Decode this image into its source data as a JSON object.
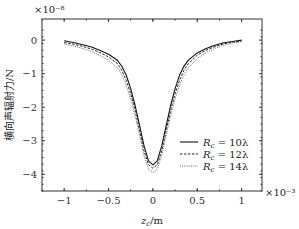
{
  "chart_data": {
    "type": "line",
    "title": "",
    "xlabel": "z_c/m",
    "ylabel": "横向声辐射力/N",
    "x_multiplier": "×10⁻³",
    "y_multiplier": "×10⁻⁸",
    "xlim": [
      -1.25,
      1.23
    ],
    "ylim": [
      -4.5,
      0.63
    ],
    "xticks": [
      -1,
      -0.5,
      0,
      0.5,
      1
    ],
    "xtick_labels": [
      "−1",
      "−0.5",
      "0",
      "0.5",
      "1"
    ],
    "yticks": [
      0,
      -1,
      -2,
      -3,
      -4
    ],
    "ytick_labels": [
      "0",
      "−1",
      "−2",
      "−3",
      "−4"
    ],
    "grid": false,
    "legend_position": "lower right",
    "x": [
      -1.0,
      -0.9,
      -0.8,
      -0.7,
      -0.6,
      -0.5,
      -0.4,
      -0.35,
      -0.3,
      -0.25,
      -0.2,
      -0.15,
      -0.1,
      -0.05,
      0.0,
      0.05,
      0.1,
      0.15,
      0.2,
      0.25,
      0.3,
      0.35,
      0.4,
      0.5,
      0.6,
      0.7,
      0.8,
      0.9,
      1.0
    ],
    "series": [
      {
        "name": "R_c = 10λ",
        "style": "solid",
        "values": [
          -0.02,
          -0.07,
          -0.13,
          -0.2,
          -0.3,
          -0.42,
          -0.6,
          -0.78,
          -1.05,
          -1.45,
          -1.95,
          -2.55,
          -3.15,
          -3.6,
          -3.72,
          -3.6,
          -3.15,
          -2.55,
          -1.95,
          -1.45,
          -1.05,
          -0.78,
          -0.6,
          -0.38,
          -0.25,
          -0.15,
          -0.08,
          -0.04,
          0.0
        ]
      },
      {
        "name": "R_c = 12λ",
        "style": "dashed",
        "values": [
          -0.07,
          -0.12,
          -0.18,
          -0.26,
          -0.37,
          -0.5,
          -0.7,
          -0.9,
          -1.2,
          -1.6,
          -2.1,
          -2.7,
          -3.3,
          -3.72,
          -3.82,
          -3.72,
          -3.3,
          -2.7,
          -2.1,
          -1.6,
          -1.2,
          -0.9,
          -0.7,
          -0.45,
          -0.3,
          -0.19,
          -0.11,
          -0.06,
          -0.03
        ]
      },
      {
        "name": "R_c = 14λ",
        "style": "dotted",
        "values": [
          -0.12,
          -0.17,
          -0.24,
          -0.33,
          -0.45,
          -0.6,
          -0.82,
          -1.03,
          -1.35,
          -1.75,
          -2.25,
          -2.85,
          -3.45,
          -3.85,
          -3.95,
          -3.85,
          -3.45,
          -2.85,
          -2.25,
          -1.75,
          -1.35,
          -1.03,
          -0.82,
          -0.55,
          -0.37,
          -0.24,
          -0.15,
          -0.09,
          -0.05
        ]
      }
    ]
  },
  "legend": {
    "items": [
      {
        "label": "R",
        "sub": "c",
        "rest": " = 10λ"
      },
      {
        "label": "R",
        "sub": "c",
        "rest": " = 12λ"
      },
      {
        "label": "R",
        "sub": "c",
        "rest": " = 14λ"
      }
    ]
  }
}
